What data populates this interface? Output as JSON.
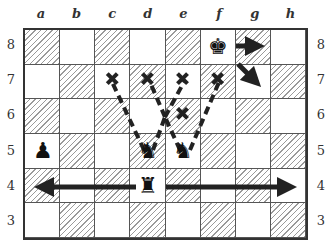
{
  "files": [
    "a",
    "b",
    "c",
    "d",
    "e",
    "f",
    "g",
    "h"
  ],
  "ranks": [
    "8",
    "7",
    "6",
    "5",
    "4",
    "3"
  ],
  "pieces": [
    {
      "square": "f8",
      "glyph": "♚",
      "name": "black-king",
      "highlight": true
    },
    {
      "square": "a5",
      "glyph": "♟",
      "name": "black-pawn",
      "highlight": true
    },
    {
      "square": "d5",
      "glyph": "♞",
      "name": "black-knight",
      "highlight": true
    },
    {
      "square": "e5",
      "glyph": "♞",
      "name": "black-knight",
      "highlight": true
    },
    {
      "square": "d4",
      "glyph": "♜",
      "name": "black-rook",
      "highlight": true
    }
  ],
  "markers": [
    "c7",
    "d7",
    "e7",
    "f7",
    "e6"
  ],
  "colors": {
    "ink": "#222222",
    "hatch": "#9a9a9a",
    "border": "#333333"
  }
}
